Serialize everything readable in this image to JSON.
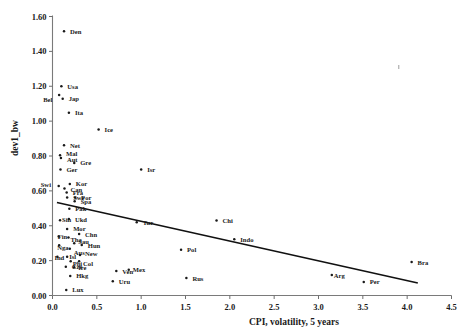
{
  "chart_data": {
    "type": "scatter",
    "title": "",
    "xlabel": "CPI, volatility, 5 years",
    "ylabel": "dev1_bw",
    "xlim": [
      0.0,
      4.5
    ],
    "ylim": [
      0.0,
      1.6
    ],
    "xticks": [
      "0.0",
      "0.5",
      "1.0",
      "1.5",
      "2.0",
      "2.5",
      "3.0",
      "3.5",
      "4.0",
      "4.5"
    ],
    "xtick_values": [
      0.0,
      0.5,
      1.0,
      1.5,
      2.0,
      2.5,
      3.0,
      3.5,
      4.0,
      4.5
    ],
    "yticks": [
      "0.00",
      "0.20",
      "0.40",
      "0.60",
      "0.80",
      "1.00",
      "1.20",
      "1.40",
      "1.60"
    ],
    "ytick_values": [
      0.0,
      0.2,
      0.4,
      0.6,
      0.8,
      1.0,
      1.2,
      1.4,
      1.6
    ],
    "grid": false,
    "legend": "none",
    "marker_shape": "small-filled-dot",
    "fit_line": {
      "kind": "linear-regression",
      "x_start": 0.05,
      "y_start": 0.533,
      "x_end": 4.12,
      "y_end": 0.072
    },
    "points": [
      {
        "label": "Den",
        "x": 0.13,
        "y": 1.515,
        "lx": 6,
        "ly": 2.5
      },
      {
        "label": "Usa",
        "x": 0.1,
        "y": 1.2,
        "lx": 6,
        "ly": 2.5
      },
      {
        "label": "Bel",
        "x": 0.075,
        "y": 1.15,
        "lx": -16,
        "ly": 7.0
      },
      {
        "label": "Jap",
        "x": 0.115,
        "y": 1.128,
        "lx": 6,
        "ly": 2.5
      },
      {
        "label": "Ita",
        "x": 0.185,
        "y": 1.048,
        "lx": 6,
        "ly": 2.5
      },
      {
        "label": "Ice",
        "x": 0.52,
        "y": 0.952,
        "lx": 6,
        "ly": 2.5
      },
      {
        "label": "Net",
        "x": 0.13,
        "y": 0.862,
        "lx": 6,
        "ly": 2.5
      },
      {
        "label": "Mal",
        "x": 0.085,
        "y": 0.805,
        "lx": 6,
        "ly": 0.5
      },
      {
        "label": "Aut",
        "x": 0.095,
        "y": 0.788,
        "lx": 6,
        "ly": 4.0
      },
      {
        "label": "Gre",
        "x": 0.245,
        "y": 0.76,
        "lx": 6,
        "ly": 2.5
      },
      {
        "label": "Ger",
        "x": 0.09,
        "y": 0.722,
        "lx": 6,
        "ly": 2.5
      },
      {
        "label": "Isr",
        "x": 1.0,
        "y": 0.722,
        "lx": 6,
        "ly": 2.5
      },
      {
        "label": "Kor",
        "x": 0.195,
        "y": 0.64,
        "lx": 6,
        "ly": 2.5
      },
      {
        "label": "Swi",
        "x": 0.07,
        "y": 0.628,
        "lx": -18,
        "ly": 1.0
      },
      {
        "label": "Can",
        "x": 0.135,
        "y": 0.613,
        "lx": 6,
        "ly": 3.5
      },
      {
        "label": "Fra",
        "x": 0.16,
        "y": 0.59,
        "lx": 6,
        "ly": 2.5
      },
      {
        "label": "Swe",
        "x": 0.165,
        "y": 0.562,
        "lx": 6,
        "ly": 2.5
      },
      {
        "label": "Por",
        "x": 0.255,
        "y": 0.562,
        "lx": 6,
        "ly": 2.5
      },
      {
        "label": "Spa",
        "x": 0.25,
        "y": 0.54,
        "lx": 6,
        "ly": 3.0
      },
      {
        "label": "Pak",
        "x": 0.19,
        "y": 0.498,
        "lx": 6,
        "ly": 2.5
      },
      {
        "label": "Sin",
        "x": 0.085,
        "y": 0.432,
        "lx": 2,
        "ly": 2.0
      },
      {
        "label": "Ukd",
        "x": 0.185,
        "y": 0.438,
        "lx": 6,
        "ly": 2.5
      },
      {
        "label": "Mor",
        "x": 0.165,
        "y": 0.382,
        "lx": 6,
        "ly": 2.5
      },
      {
        "label": "Chn",
        "x": 0.3,
        "y": 0.352,
        "lx": 6,
        "ly": 2.5
      },
      {
        "label": "Fin",
        "x": 0.07,
        "y": 0.338,
        "lx": -1,
        "ly": 2.0
      },
      {
        "label": "Tha",
        "x": 0.18,
        "y": 0.332,
        "lx": 2,
        "ly": 4.0
      },
      {
        "label": "Sau",
        "x": 0.245,
        "y": 0.3,
        "lx": 4,
        "ly": 1.0
      },
      {
        "label": "Hun",
        "x": 0.33,
        "y": 0.29,
        "lx": 6,
        "ly": 3.5
      },
      {
        "label": "Nga",
        "x": 0.075,
        "y": 0.288,
        "lx": -2,
        "ly": 4.5
      },
      {
        "label": "Aus",
        "x": 0.195,
        "y": 0.268,
        "lx": 4,
        "ly": 6.0
      },
      {
        "label": "Ind",
        "x": 0.055,
        "y": 0.222,
        "lx": -3,
        "ly": 3.0
      },
      {
        "label": "Isl",
        "x": 0.165,
        "y": 0.222,
        "lx": 2,
        "ly": 2.5
      },
      {
        "label": "New",
        "x": 0.31,
        "y": 0.232,
        "lx": 5,
        "ly": 1.0
      },
      {
        "label": "Phi",
        "x": 0.205,
        "y": 0.196,
        "lx": 2,
        "ly": 5.0
      },
      {
        "label": "Col",
        "x": 0.3,
        "y": 0.196,
        "lx": 4,
        "ly": 5.0
      },
      {
        "label": "Cze",
        "x": 0.15,
        "y": 0.165,
        "lx": 6,
        "ly": 2.5
      },
      {
        "label": "Ire",
        "x": 0.245,
        "y": 0.162,
        "lx": 4,
        "ly": 2.5
      },
      {
        "label": "Hkg",
        "x": 0.2,
        "y": 0.112,
        "lx": 6,
        "ly": 2.5
      },
      {
        "label": "Lux",
        "x": 0.155,
        "y": 0.032,
        "lx": 6,
        "ly": 2.5
      },
      {
        "label": "Ven",
        "x": 0.72,
        "y": 0.14,
        "lx": 6,
        "ly": 2.5
      },
      {
        "label": "Mex",
        "x": 0.86,
        "y": 0.148,
        "lx": 4,
        "ly": 2.5
      },
      {
        "label": "Uru",
        "x": 0.68,
        "y": 0.082,
        "lx": 6,
        "ly": 2.5
      },
      {
        "label": "Tur",
        "x": 0.95,
        "y": 0.42,
        "lx": 6,
        "ly": 2.5
      },
      {
        "label": "Pol",
        "x": 1.45,
        "y": 0.262,
        "lx": 6,
        "ly": 2.5
      },
      {
        "label": "Rus",
        "x": 1.51,
        "y": 0.1,
        "lx": 6,
        "ly": 2.5
      },
      {
        "label": "Chi",
        "x": 1.85,
        "y": 0.43,
        "lx": 6,
        "ly": 2.5
      },
      {
        "label": "Indo",
        "x": 2.05,
        "y": 0.322,
        "lx": 6,
        "ly": 2.5
      },
      {
        "label": "Arg",
        "x": 3.15,
        "y": 0.118,
        "lx": 2,
        "ly": 3.0
      },
      {
        "label": "Per",
        "x": 3.51,
        "y": 0.078,
        "lx": 6,
        "ly": 2.5
      },
      {
        "label": "Bra",
        "x": 4.05,
        "y": 0.192,
        "lx": 6,
        "ly": 2.5
      }
    ]
  }
}
